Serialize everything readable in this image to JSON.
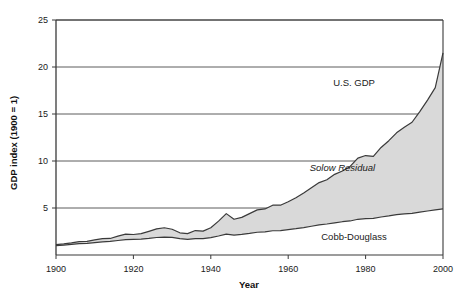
{
  "chart_data": {
    "type": "area",
    "title": "",
    "subtitle": "",
    "xlabel": "Year",
    "ylabel": "GDP index (1900 = 1)",
    "xlim": [
      1900,
      2000
    ],
    "ylim": [
      0,
      25
    ],
    "ytick_labels": [
      "25",
      "20",
      "15",
      "10",
      "5"
    ],
    "yticks": [
      25,
      20,
      15,
      10,
      5
    ],
    "xtick_labels": [
      "1900",
      "1920",
      "1940",
      "1960",
      "1980",
      "2000"
    ],
    "xticks": [
      1900,
      1920,
      1940,
      1960,
      1980,
      2000
    ],
    "grid": "horizontal",
    "legend_position": "inline-annotations",
    "stacked": true,
    "fill_color": "#d9d9d9",
    "line_color": "#3a3a3a",
    "annotations": [
      {
        "name": "us-gdp",
        "text": "U.S. GDP",
        "x": 1977,
        "y": 18.0,
        "style": "regular"
      },
      {
        "name": "solow-residual",
        "text": "Solow Residual",
        "x": 1974,
        "y": 8.9,
        "style": "italic"
      },
      {
        "name": "cobb-douglass",
        "text": "Cobb-Douglass",
        "x": 1977,
        "y": 1.6,
        "style": "regular"
      }
    ],
    "x": [
      1900,
      1902,
      1904,
      1906,
      1908,
      1910,
      1912,
      1914,
      1916,
      1918,
      1920,
      1922,
      1924,
      1926,
      1928,
      1930,
      1932,
      1934,
      1936,
      1938,
      1940,
      1942,
      1944,
      1946,
      1948,
      1950,
      1952,
      1954,
      1956,
      1958,
      1960,
      1962,
      1964,
      1966,
      1968,
      1970,
      1972,
      1974,
      1976,
      1978,
      1980,
      1982,
      1984,
      1986,
      1988,
      1990,
      1992,
      1994,
      1996,
      1998,
      2000
    ],
    "series": [
      {
        "name": "Cobb-Douglass",
        "description": "Contribution of capital and labor inputs (lower band)",
        "values": [
          1.0,
          1.06,
          1.13,
          1.21,
          1.24,
          1.32,
          1.4,
          1.44,
          1.54,
          1.64,
          1.66,
          1.68,
          1.76,
          1.86,
          1.9,
          1.88,
          1.74,
          1.66,
          1.74,
          1.74,
          1.84,
          2.02,
          2.22,
          2.12,
          2.2,
          2.3,
          2.42,
          2.46,
          2.58,
          2.6,
          2.7,
          2.8,
          2.92,
          3.06,
          3.2,
          3.3,
          3.42,
          3.54,
          3.62,
          3.8,
          3.88,
          3.9,
          4.04,
          4.16,
          4.3,
          4.38,
          4.42,
          4.56,
          4.68,
          4.8,
          4.9
        ]
      },
      {
        "name": "Solow Residual",
        "description": "Residual total factor productivity (upper band, stacked on Cobb-Douglass)",
        "values": [
          0.1,
          0.12,
          0.16,
          0.22,
          0.2,
          0.28,
          0.34,
          0.32,
          0.46,
          0.58,
          0.52,
          0.6,
          0.76,
          0.92,
          1.0,
          0.86,
          0.62,
          0.62,
          0.86,
          0.8,
          1.06,
          1.58,
          2.18,
          1.68,
          1.8,
          2.1,
          2.38,
          2.44,
          2.72,
          2.7,
          2.96,
          3.3,
          3.68,
          4.1,
          4.5,
          4.7,
          5.16,
          5.4,
          5.8,
          6.5,
          6.7,
          6.6,
          7.4,
          8.0,
          8.7,
          9.2,
          9.7,
          10.7,
          11.8,
          13.0,
          16.6
        ]
      }
    ],
    "total_series": {
      "name": "U.S. GDP",
      "description": "Total GDP index = Cobb-Douglass + Solow Residual",
      "values": [
        1.1,
        1.18,
        1.29,
        1.43,
        1.44,
        1.6,
        1.74,
        1.76,
        2.0,
        2.22,
        2.18,
        2.28,
        2.52,
        2.78,
        2.9,
        2.74,
        2.36,
        2.28,
        2.6,
        2.54,
        2.9,
        3.6,
        4.4,
        3.8,
        4.0,
        4.4,
        4.8,
        4.9,
        5.3,
        5.3,
        5.66,
        6.1,
        6.6,
        7.16,
        7.7,
        8.0,
        8.58,
        8.94,
        9.42,
        10.3,
        10.58,
        10.5,
        11.44,
        12.16,
        13.0,
        13.58,
        14.12,
        15.26,
        16.48,
        17.8,
        21.5
      ]
    }
  }
}
